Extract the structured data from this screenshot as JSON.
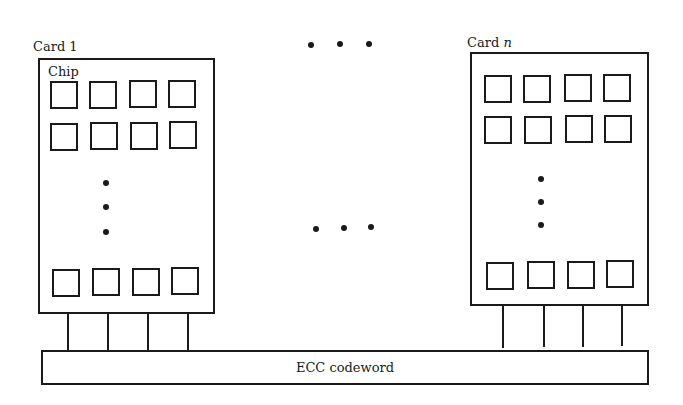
{
  "diagram": {
    "cards": [
      {
        "label": "Card 1",
        "chip_label": "Chip",
        "chip_rows_visible": 3,
        "chips_per_row": 4
      },
      {
        "label_prefix": "Card ",
        "label_var": "n",
        "chip_rows_visible": 3,
        "chips_per_row": 4
      }
    ],
    "bus": {
      "label": "ECC codeword"
    },
    "ellipsis": {
      "horizontal_top": "• • •",
      "horizontal_middle": "• • •",
      "vertical": "⋮"
    }
  }
}
